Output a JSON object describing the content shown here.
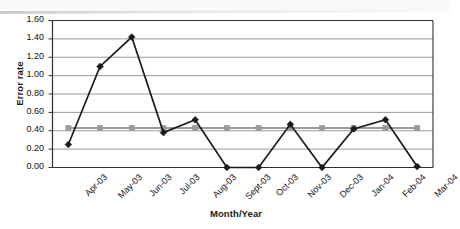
{
  "chart_data": {
    "type": "line",
    "title": "",
    "xlabel": "Month/Year",
    "ylabel": "Error rate",
    "categories": [
      "Apr-03",
      "May-03",
      "Jun-03",
      "Jul-03",
      "Aug-03",
      "Sept-03",
      "Oct-03",
      "Nov-03",
      "Dec-03",
      "Jan-04",
      "Feb-04",
      "Mar-04"
    ],
    "ylim": [
      0.0,
      1.6
    ],
    "ytick_labels": [
      "0.00",
      "0.20",
      "0.40",
      "0.60",
      "0.80",
      "1.00",
      "1.20",
      "1.40",
      "1.60"
    ],
    "ytick_values": [
      0.0,
      0.2,
      0.4,
      0.6,
      0.8,
      1.0,
      1.2,
      1.4,
      1.6
    ],
    "grid": "horizontal",
    "legend": "none",
    "series": [
      {
        "name": "Error rate",
        "marker": "diamond",
        "color": "#1a1a1a",
        "values": [
          0.25,
          1.1,
          1.42,
          0.38,
          0.52,
          0.0,
          0.0,
          0.47,
          0.0,
          0.42,
          0.52,
          0.01
        ]
      },
      {
        "name": "Target",
        "marker": "square",
        "color": "#9a9a9a",
        "values": [
          0.43,
          0.43,
          0.43,
          0.43,
          0.43,
          0.43,
          0.43,
          0.43,
          0.43,
          0.43,
          0.43,
          0.43
        ]
      }
    ]
  },
  "axis": {
    "y_title": "Error rate",
    "x_title": "Month/Year"
  }
}
